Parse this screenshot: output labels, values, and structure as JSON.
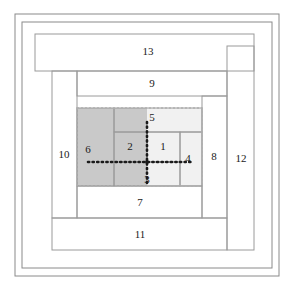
{
  "figure": {
    "canvas": {
      "width": 294,
      "height": 291
    },
    "colors": {
      "background": "#ffffff",
      "outer_frame_stroke": "#8a8a8a",
      "tile_stroke": "#9a9a9a",
      "dark_shade": "#c9c9c9",
      "light_shade": "#f1f1f1",
      "dashed_boundary": "#b0b0b0",
      "axis_dotted": "#1a1a1a",
      "label_text": "#1a1a1a"
    }
  },
  "chart_data": {
    "type": "diagram",
    "xlabel": "",
    "ylabel": "",
    "grid": false,
    "legend": "none",
    "tiles": [
      {
        "id": 1,
        "label": "1",
        "x": 147,
        "y": 132,
        "w": 33,
        "h": 30,
        "shade": "light",
        "label_x": 163,
        "label_y": 147
      },
      {
        "id": 2,
        "label": "2",
        "x": 114,
        "y": 132,
        "w": 33,
        "h": 30,
        "shade": "dark",
        "label_x": 130,
        "label_y": 147
      },
      {
        "id": 3,
        "label": "3",
        "x": 114,
        "y": 162,
        "w": 66,
        "h": 24,
        "shade": "split",
        "label_x": 147,
        "label_y": 180
      },
      {
        "id": 4,
        "label": "4",
        "x": 180,
        "y": 132,
        "w": 22,
        "h": 54,
        "shade": "light",
        "label_x": 188,
        "label_y": 159
      },
      {
        "id": 5,
        "label": "5",
        "x": 114,
        "y": 108,
        "w": 88,
        "h": 24,
        "shade": "split",
        "label_x": 152,
        "label_y": 118
      },
      {
        "id": 6,
        "label": "6",
        "x": 77,
        "y": 108,
        "w": 37,
        "h": 78,
        "shade": "dark",
        "label_x": 88,
        "label_y": 150
      },
      {
        "id": 7,
        "label": "7",
        "x": 77,
        "y": 186,
        "w": 125,
        "h": 32,
        "shade": "none",
        "label_x": 140,
        "label_y": 203
      },
      {
        "id": 8,
        "label": "8",
        "x": 202,
        "y": 96,
        "w": 25,
        "h": 122,
        "shade": "none",
        "label_x": 214,
        "label_y": 157
      },
      {
        "id": 9,
        "label": "9",
        "x": 77,
        "y": 71,
        "w": 150,
        "h": 25,
        "shade": "none",
        "label_x": 152,
        "label_y": 84
      },
      {
        "id": 10,
        "label": "10",
        "x": 52,
        "y": 71,
        "w": 25,
        "h": 147,
        "shade": "none",
        "label_x": 64,
        "label_y": 155
      },
      {
        "id": 11,
        "label": "11",
        "x": 52,
        "y": 218,
        "w": 175,
        "h": 32,
        "shade": "none",
        "label_x": 140,
        "label_y": 235
      },
      {
        "id": 12,
        "label": "12",
        "x": 227,
        "y": 46,
        "w": 27,
        "h": 204,
        "shade": "none",
        "label_x": 241,
        "label_y": 159
      },
      {
        "id": 13,
        "label": "13",
        "x": 35,
        "y": 34,
        "w": 219,
        "h": 37,
        "shade": "none",
        "label_x": 148,
        "label_y": 52
      }
    ],
    "dark_region": {
      "x": 77,
      "y": 108,
      "w": 70,
      "h": 78
    },
    "light_region": {
      "x": 114,
      "y": 108,
      "w": 88,
      "h": 78
    },
    "dashed_boundary": {
      "x": 77,
      "y": 108,
      "w": 125,
      "h": 78
    },
    "origin_point": {
      "x": 147,
      "y": 162
    },
    "dotted_axes": {
      "vertical": {
        "x": 147,
        "y1": 122,
        "y2": 186
      },
      "horizontal": {
        "y": 162,
        "x1": 88,
        "x2": 191
      }
    },
    "outer_frames": [
      {
        "name": "outer-frame",
        "x": 15,
        "y": 14,
        "w": 264,
        "h": 262
      },
      {
        "name": "inner-frame",
        "x": 22,
        "y": 22,
        "w": 250,
        "h": 246
      }
    ]
  }
}
